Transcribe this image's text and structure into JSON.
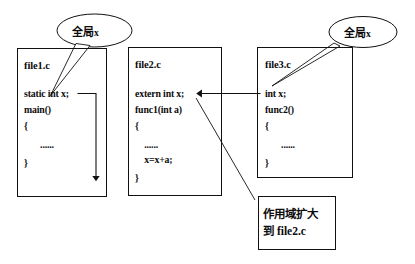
{
  "diagram": {
    "stroke_color": "#111111",
    "text_color": "#0c0c0c",
    "background": "#ffffff"
  },
  "files": [
    {
      "name": "file1.c",
      "lines": [
        "static int x;",
        "main()",
        "{",
        "       ......",
        "}"
      ]
    },
    {
      "name": "file2.c",
      "lines": [
        "extern int x;",
        "func1(int a)",
        "{",
        "    ......",
        "    x=x+a;",
        "}"
      ]
    },
    {
      "name": "file3.c",
      "lines": [
        "int x;",
        "func2()",
        "{",
        "       ......",
        "}"
      ]
    }
  ],
  "callouts": [
    {
      "id": "left",
      "text": "全局",
      "suffix": "x"
    },
    {
      "id": "right",
      "text": "全局",
      "suffix": "x"
    }
  ],
  "note": {
    "line1": "作用域扩大",
    "line2": "到 file2.c"
  }
}
